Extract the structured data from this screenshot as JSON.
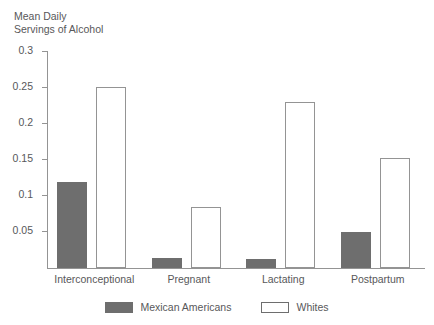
{
  "chart_data": {
    "type": "bar",
    "title": "Mean Daily\nServings of Alcohol",
    "xlabel": "",
    "ylabel": "Mean Daily Servings of Alcohol",
    "categories": [
      "Interconceptional",
      "Pregnant",
      "Lactating",
      "Postpartum"
    ],
    "series": [
      {
        "name": "Mexican Americans",
        "color": "#6e6e6e",
        "values": [
          0.12,
          0.014,
          0.012,
          0.05
        ]
      },
      {
        "name": "Whites",
        "color": "#ffffff",
        "values": [
          0.252,
          0.085,
          0.23,
          0.153
        ]
      }
    ],
    "ylim": [
      0,
      0.3
    ],
    "yticks": [
      0.05,
      0.1,
      0.15,
      0.2,
      0.25,
      0.3
    ],
    "ytick_labels": [
      "0.05",
      "0.1",
      "0.15",
      "0.2",
      "0.25",
      "0.3"
    ],
    "grid": false,
    "legend_position": "bottom-center",
    "axis_color": "#949494",
    "text_color": "#58585a"
  },
  "legend": {
    "items": [
      {
        "label": "Mexican Americans",
        "style": "dark"
      },
      {
        "label": "Whites",
        "style": "light"
      }
    ]
  }
}
